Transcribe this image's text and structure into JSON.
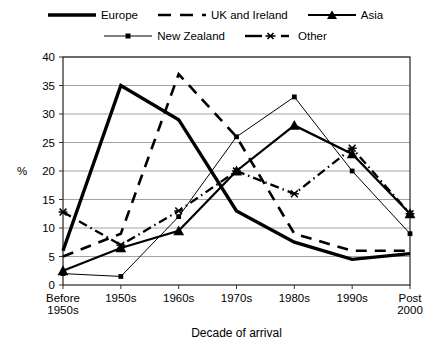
{
  "chart_data": {
    "type": "line",
    "title": "",
    "xlabel": "Decade of arrival",
    "ylabel": "%",
    "ylim": [
      0,
      40
    ],
    "ytick_step": 5,
    "grid": true,
    "legend_position": "top",
    "categories": [
      "Before 1950s",
      "1950s",
      "1960s",
      "1970s",
      "1980s",
      "1990s",
      "Post 2000"
    ],
    "ytick_labels": [
      "0",
      "5",
      "10",
      "15",
      "20",
      "25",
      "30",
      "35",
      "40"
    ],
    "series": [
      {
        "name": "Europe",
        "style": "solid-thick",
        "marker": "none",
        "color": "#000000",
        "values": [
          6,
          35,
          29,
          13,
          7.5,
          4.5,
          5.5
        ]
      },
      {
        "name": "UK and Ireland",
        "style": "dashed-thick",
        "marker": "none",
        "color": "#000000",
        "values": [
          5,
          9,
          37,
          26,
          9,
          6,
          6
        ]
      },
      {
        "name": "Asia",
        "style": "solid-medium",
        "marker": "triangle",
        "color": "#000000",
        "values": [
          2.5,
          6.5,
          9.5,
          20,
          28,
          23,
          12.5
        ]
      },
      {
        "name": "New Zealand",
        "style": "solid-thin",
        "marker": "square",
        "color": "#000000",
        "values": [
          2,
          1.5,
          12,
          26,
          33,
          20,
          9
        ]
      },
      {
        "name": "Other",
        "style": "dash-dot",
        "marker": "star",
        "color": "#000000",
        "values": [
          12.8,
          7,
          13,
          20,
          16,
          24,
          12.5
        ]
      }
    ]
  },
  "legend": {
    "rows": [
      [
        {
          "label": "Europe",
          "icon": "solid-thick-line-icon"
        },
        {
          "label": "UK and Ireland",
          "icon": "dashed-line-icon"
        },
        {
          "label": "Asia",
          "icon": "triangle-marker-line-icon"
        }
      ],
      [
        {
          "label": "New Zealand",
          "icon": "square-marker-line-icon"
        },
        {
          "label": "Other",
          "icon": "dash-dot-star-line-icon"
        }
      ]
    ]
  }
}
